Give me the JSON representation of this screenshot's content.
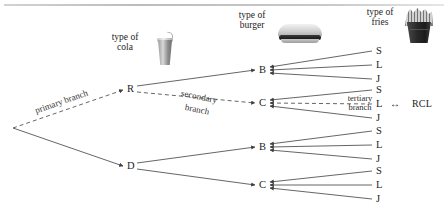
{
  "diagram": {
    "root": {
      "label": "",
      "x": 12,
      "y": 128
    },
    "icons": {
      "cola": "soda-cup-icon",
      "burger": "hamburger-icon",
      "fries": "french-fries-icon"
    },
    "captions": [
      {
        "name": "cola-caption",
        "line1": "type of",
        "line2": "cola",
        "x": 113,
        "y": 33
      },
      {
        "name": "burger-caption",
        "line1": "type of",
        "line2": "burger",
        "x": 236,
        "y": 11
      },
      {
        "name": "fries-caption",
        "line1": "type of",
        "line2": "fries",
        "x": 360,
        "y": 8
      }
    ],
    "branch_labels": {
      "primary": "primary branch",
      "secondary_line1": "secondary",
      "secondary_line2": "branch",
      "tertiary_line1": "tertiary",
      "tertiary_line2": "branch"
    },
    "outcome": {
      "code": "RCL",
      "arrow": "↔"
    },
    "level1": [
      {
        "name": "node-R",
        "label": "R",
        "x": 130,
        "y": 89
      },
      {
        "name": "node-D",
        "label": "D",
        "x": 130,
        "y": 166
      }
    ],
    "level2": [
      {
        "name": "node-R-B",
        "label": "B",
        "parent": "R",
        "x": 262,
        "y": 70
      },
      {
        "name": "node-R-C",
        "label": "C",
        "parent": "R",
        "x": 262,
        "y": 103
      },
      {
        "name": "node-D-B",
        "label": "B",
        "parent": "D",
        "x": 262,
        "y": 147
      },
      {
        "name": "node-D-C",
        "label": "C",
        "parent": "D",
        "x": 262,
        "y": 185
      }
    ],
    "level3_labels": [
      "S",
      "L",
      "J"
    ],
    "leaves": [
      {
        "name": "leaf-R-B-S",
        "label": "S",
        "x": 378,
        "y": 52
      },
      {
        "name": "leaf-R-B-L",
        "label": "L",
        "x": 378,
        "y": 66
      },
      {
        "name": "leaf-R-B-J",
        "label": "J",
        "x": 378,
        "y": 80
      },
      {
        "name": "leaf-R-C-S",
        "label": "S",
        "x": 378,
        "y": 91
      },
      {
        "name": "leaf-R-C-L",
        "label": "L",
        "x": 378,
        "y": 105
      },
      {
        "name": "leaf-R-C-J",
        "label": "J",
        "x": 378,
        "y": 119
      },
      {
        "name": "leaf-D-B-S",
        "label": "S",
        "x": 378,
        "y": 132
      },
      {
        "name": "leaf-D-B-L",
        "label": "L",
        "x": 378,
        "y": 146
      },
      {
        "name": "leaf-D-B-J",
        "label": "J",
        "x": 378,
        "y": 160
      },
      {
        "name": "leaf-D-C-S",
        "label": "S",
        "x": 378,
        "y": 172
      },
      {
        "name": "leaf-D-C-L",
        "label": "L",
        "x": 378,
        "y": 186
      },
      {
        "name": "leaf-D-C-J",
        "label": "J",
        "x": 378,
        "y": 200
      }
    ],
    "colors": {
      "line": "#4a4a4a",
      "text": "#232323",
      "rule": "#c6c6c6"
    }
  }
}
